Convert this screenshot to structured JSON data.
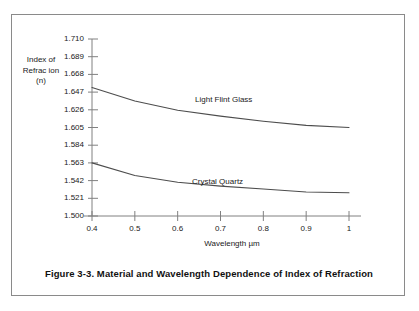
{
  "figure": {
    "caption": "Figure 3-3.  Material and Wavelength Dependence of Index of Refraction"
  },
  "chart_data": {
    "type": "line",
    "title": "",
    "xlabel": "Wavelength µm",
    "ylabel": "Index of\nRefrac ion\n(n)",
    "ylabel_lines": [
      "Index of",
      "Refrac ion",
      "(n)"
    ],
    "xlim": [
      0.35,
      1.06
    ],
    "ylim": [
      1.5,
      1.71
    ],
    "grid": false,
    "legend_position": "inline-annotation",
    "xticks": [
      0.4,
      0.5,
      0.6,
      0.7,
      0.8,
      0.9,
      1
    ],
    "xtick_labels": [
      "0.4",
      "0.5",
      "0.6",
      "0.7",
      "0.8",
      "0.9",
      "1"
    ],
    "yticks": [
      1.71,
      1.689,
      1.668,
      1.647,
      1.626,
      1.605,
      1.584,
      1.563,
      1.542,
      1.521,
      1.5
    ],
    "ytick_labels": [
      "1.710",
      "1.689",
      "1.668",
      "1.647",
      "1.626",
      "1.605",
      "1.584",
      "1.563",
      "1.542",
      "1.521",
      "1.500"
    ],
    "series": [
      {
        "name": "Light Flint Glass",
        "color": "#4d4d4d",
        "x": [
          0.4,
          0.5,
          0.6,
          0.7,
          0.8,
          0.9,
          1.0
        ],
        "values": [
          1.6525,
          1.6365,
          1.6255,
          1.6185,
          1.6125,
          1.6075,
          1.605
        ]
      },
      {
        "name": "Crystal Quartz",
        "color": "#4d4d4d",
        "x": [
          0.4,
          0.5,
          0.6,
          0.7,
          0.8,
          0.9,
          1.0
        ],
        "values": [
          1.563,
          1.548,
          1.54,
          1.5355,
          1.532,
          1.5285,
          1.5275
        ]
      }
    ]
  }
}
